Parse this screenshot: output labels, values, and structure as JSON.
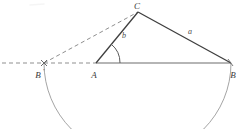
{
  "figure": {
    "kind": "geometry-diagram",
    "canvas": {
      "width": 241,
      "height": 129
    },
    "colors": {
      "solid_line": "#404040",
      "dashed_line": "#8a8a8a",
      "arc_line": "#909090",
      "baseline": "#707070",
      "label_text": "#3a3a3a",
      "background": "#ffffff"
    },
    "points": [
      {
        "id": "C",
        "label": "C",
        "x": 138,
        "y": 12,
        "label_x": 137,
        "label_y": 8,
        "marker": false
      },
      {
        "id": "A",
        "label": "A",
        "x": 96,
        "y": 63,
        "label_x": 93,
        "label_y": 76,
        "marker": false
      },
      {
        "id": "B",
        "label": "B",
        "x": 231,
        "y": 63,
        "label_x": 231,
        "label_y": 76,
        "marker": false
      },
      {
        "id": "Bp",
        "label": "B",
        "prime": "'",
        "x": 44,
        "y": 63,
        "label_x": 37,
        "label_y": 76,
        "marker": true
      }
    ],
    "segments": [
      {
        "id": "AC",
        "from": "A",
        "to": "C",
        "style": "solid",
        "label": "b"
      },
      {
        "id": "CB",
        "from": "C",
        "to": "B",
        "style": "solid",
        "label": "a"
      },
      {
        "id": "AB",
        "from": "A",
        "to": "B",
        "style": "solid",
        "label": ""
      },
      {
        "id": "BpC",
        "from": "Bp",
        "to": "C",
        "style": "dashed",
        "label": ""
      },
      {
        "id": "ray",
        "from": "origin-left",
        "to": "A",
        "style": "dashed",
        "label": ""
      }
    ],
    "side_labels": [
      {
        "id": "side-a",
        "text": "a",
        "x": 190,
        "y": 33
      },
      {
        "id": "side-b",
        "text": "b",
        "x": 124,
        "y": 37
      }
    ],
    "angle_marks": [
      {
        "id": "angle-A",
        "at": "A",
        "radius": 24,
        "from_deg": 0,
        "to_deg": 51
      }
    ],
    "arcs": [
      {
        "id": "arc-BpB",
        "center": "A",
        "radius": 135,
        "from": "Bp",
        "to": "B",
        "direction": "below"
      }
    ],
    "dashed_ray": {
      "x_start": 0,
      "x_end": 96,
      "y": 63
    },
    "baseline": {
      "x_start": 96,
      "x_end": 231,
      "y": 63
    }
  }
}
